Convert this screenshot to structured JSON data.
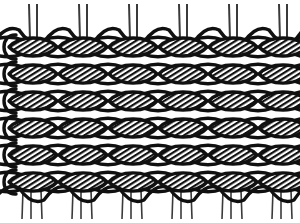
{
  "figure": {
    "title": "Knitted mesh fabric structure",
    "description": "Technical line drawing of an interlocking looped mesh textile with hatched (shaded) lens-shaped loops and open white loops, with paired vertical warp threads extending above and below the fabric body.",
    "domain_label": "Diagram",
    "background_color": "#ffffff",
    "ink_color": "#101010",
    "hatch_color": "#101010",
    "open_loop_fill": "#ffffff",
    "thread_color": "#3a3a3a"
  },
  "geometry": {
    "width": 300,
    "height": 223,
    "fabric_top": 34,
    "fabric_bottom": 196,
    "columns": 6,
    "rows": 6,
    "column_pitch": 50,
    "row_pitch": 27,
    "left_margin": 8,
    "hatch_angle_deg": 58,
    "hatch_spacing": 3.2,
    "loop_half_width": 25,
    "loop_half_height": 11
  },
  "rows": [
    {
      "index": 1,
      "y_center": 47,
      "label": "row-1",
      "loop_type": "hatched"
    },
    {
      "index": 2,
      "y_center": 74,
      "label": "row-2",
      "loop_type": "hatched"
    },
    {
      "index": 3,
      "y_center": 101,
      "label": "row-3",
      "loop_type": "hatched"
    },
    {
      "index": 4,
      "y_center": 128,
      "label": "row-4",
      "loop_type": "hatched"
    },
    {
      "index": 5,
      "y_center": 155,
      "label": "row-5",
      "loop_type": "hatched"
    },
    {
      "index": 6,
      "y_center": 182,
      "label": "row-6",
      "loop_type": "hatched"
    }
  ],
  "columns": [
    {
      "index": 1,
      "x_center": 33
    },
    {
      "index": 2,
      "x_center": 83
    },
    {
      "index": 3,
      "x_center": 133
    },
    {
      "index": 4,
      "x_center": 183
    },
    {
      "index": 5,
      "x_center": 233
    },
    {
      "index": 6,
      "x_center": 283
    }
  ],
  "top_threads": {
    "name": "top-warp-threads",
    "count_pairs": 6,
    "pair_gap": 7,
    "top_y": 4,
    "pair_x_centers": [
      33,
      83,
      133,
      183,
      233,
      283
    ],
    "stroke_width": 2.0
  },
  "bottom_threads": {
    "name": "bottom-warp-threads",
    "count_pairs": 6,
    "pair_gap": 7,
    "bottom_y": 219,
    "pair_x_centers": [
      33,
      83,
      133,
      183,
      233,
      283
    ],
    "stroke_width": 1.6
  },
  "chart_data": {
    "type": "diagram",
    "title": "Knitted mesh fabric structure",
    "grid": "off",
    "legend": "none"
  }
}
